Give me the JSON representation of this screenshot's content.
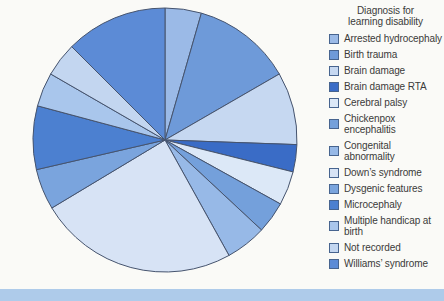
{
  "chart_data": {
    "type": "pie",
    "title": "Diagnosis for learning disability",
    "legend_position": "right",
    "start_angle_deg": 0,
    "direction": "clockwise",
    "data_labels_shown": false,
    "categories": [
      "Arrested hydrocephaly",
      "Birth trauma",
      "Brain damage",
      "Brain damage RTA",
      "Cerebral palsy",
      "Chickenpox encephalitis",
      "Congenital abnormality",
      "Down’s syndrome",
      "Dysgenic features",
      "Microcephaly",
      "Multiple handicap at birth",
      "Not recorded",
      "Williams’ syndrome"
    ],
    "values_percent": [
      4.4,
      12.2,
      8.9,
      3.3,
      4.2,
      3.9,
      5.0,
      24.4,
      5.0,
      7.8,
      4.2,
      4.2,
      12.5
    ],
    "angles_deg": [
      16,
      44,
      32,
      12,
      15,
      14,
      18,
      88,
      18,
      28,
      15,
      15,
      45
    ],
    "colors": [
      "#9BBAE7",
      "#6E9AD9",
      "#C6D8F1",
      "#3A6CC6",
      "#DCE8F7",
      "#74A0DB",
      "#97B9E7",
      "#D7E3F5",
      "#7AA4DD",
      "#4C80D0",
      "#A9C6EC",
      "#C3D6F0",
      "#5C8BD6"
    ]
  },
  "style_colors": {
    "background": "#FAFAF7",
    "slice_stroke": "#46546E",
    "legend_swatch_border": "#47648F",
    "legend_text": "#3A3A3A",
    "footer_bar": "#AECBEA"
  }
}
